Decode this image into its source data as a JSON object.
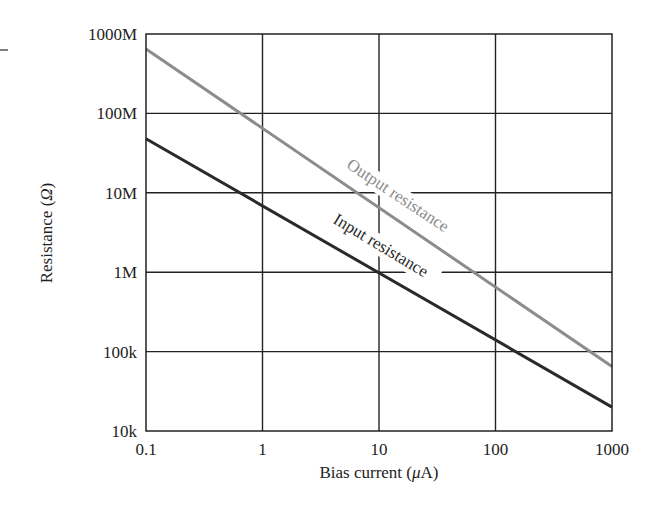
{
  "chart_data": {
    "type": "line",
    "title": "",
    "xlabel": "Bias current (μA)",
    "ylabel": "Resistance (Ω)",
    "xscale": "log",
    "yscale": "log",
    "xlim": [
      0.1,
      1000
    ],
    "ylim": [
      10000,
      1000000000
    ],
    "grid": true,
    "x_tick_labels": [
      "0.1",
      "1",
      "10",
      "100",
      "1000"
    ],
    "y_tick_labels": [
      "1000M",
      "100M",
      "10M",
      "1M",
      "100k",
      "10k"
    ],
    "series": [
      {
        "name": "Output resistance",
        "color": "#8c8c8c",
        "x": [
          0.1,
          1000
        ],
        "values": [
          650000000,
          65000
        ]
      },
      {
        "name": "Input resistance",
        "color": "#2a2a2a",
        "x": [
          0.1,
          1000
        ],
        "values": [
          48000000,
          20000
        ]
      }
    ],
    "annotations": [
      "Output resistance",
      "Input resistance"
    ]
  },
  "labels": {
    "xlabel_prefix": "Bias current (",
    "xlabel_mu": "μ",
    "xlabel_suffix": "A)",
    "ylabel_prefix": "Resistance (",
    "ylabel_omega": "Ω",
    "ylabel_suffix": ")"
  }
}
